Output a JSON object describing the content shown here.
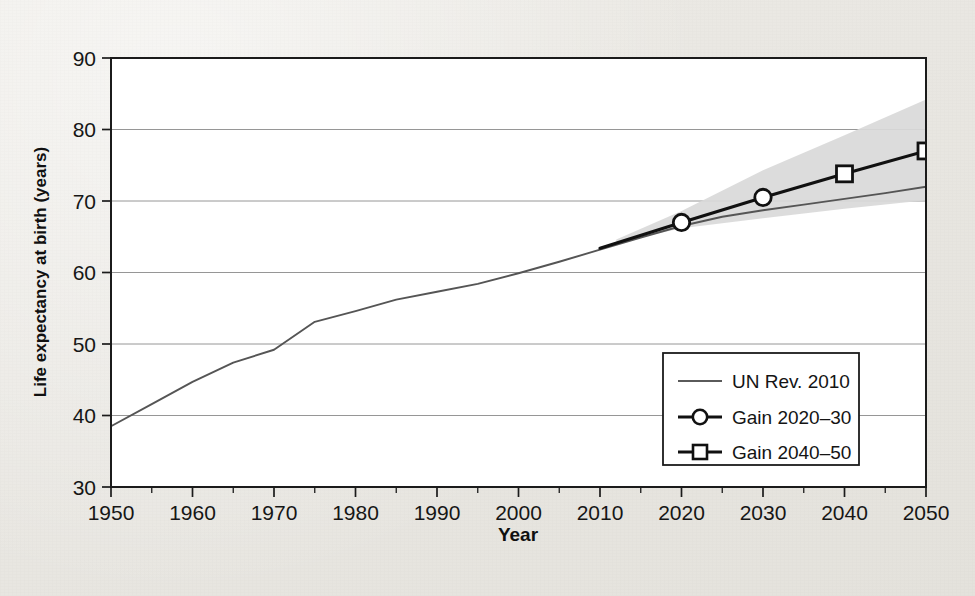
{
  "chart_data": {
    "type": "line",
    "title": "",
    "xlabel": "Year",
    "ylabel": "Life expectancy at birth (years)",
    "xlim": [
      1950,
      2050
    ],
    "ylim": [
      30,
      90
    ],
    "xticks": [
      1950,
      1960,
      1970,
      1980,
      1990,
      2000,
      2010,
      2020,
      2030,
      2040,
      2050
    ],
    "xtick_labels": [
      "1950",
      "1960",
      "1970",
      "1980",
      "1990",
      "2000",
      "2010",
      "2020",
      "2030",
      "2040",
      "2050"
    ],
    "xminor_ticks": [
      1955,
      1965,
      1975,
      1985,
      1995,
      2005,
      2015,
      2025,
      2035,
      2045
    ],
    "yticks": [
      30,
      40,
      50,
      60,
      70,
      80,
      90
    ],
    "ytick_labels": [
      "30",
      "40",
      "50",
      "60",
      "70",
      "80",
      "90"
    ],
    "grid": "horizontal",
    "legend_position": "lower right",
    "series": [
      {
        "name": "UN Rev. 2010",
        "marker": "none",
        "color": "#555555",
        "x": [
          1950,
          1955,
          1960,
          1965,
          1970,
          1975,
          1980,
          1985,
          1990,
          1995,
          2000,
          2005,
          2010,
          2015,
          2020,
          2025,
          2030,
          2035,
          2040,
          2045,
          2050
        ],
        "y": [
          38.5,
          41.6,
          44.7,
          47.4,
          49.2,
          53.1,
          54.6,
          56.2,
          57.3,
          58.4,
          59.9,
          61.5,
          63.2,
          64.9,
          66.5,
          67.8,
          68.7,
          69.5,
          70.3,
          71.1,
          72.0
        ]
      },
      {
        "name": "Gain 2020-30",
        "marker": "circle",
        "color": "#111111",
        "x": [
          2010,
          2020,
          2030
        ],
        "y": [
          63.4,
          67.0,
          70.5
        ]
      },
      {
        "name": "Gain 2040-50",
        "marker": "square",
        "color": "#111111",
        "x": [
          2030,
          2040,
          2050
        ],
        "y": [
          70.5,
          73.8,
          77.0
        ]
      }
    ],
    "uncertainty_band": {
      "name": "projection uncertainty",
      "color": "#d9d9d9",
      "x": [
        2012,
        2020,
        2030,
        2040,
        2050
      ],
      "upper": [
        64.6,
        68.6,
        74.3,
        79.2,
        84.2
      ],
      "lower": [
        64.2,
        66.2,
        67.6,
        68.9,
        70.1
      ]
    }
  },
  "legend": {
    "entries": [
      {
        "label": "UN Rev. 2010",
        "marker": "none"
      },
      {
        "label": "Gain 2020–30",
        "marker": "circle"
      },
      {
        "label": "Gain 2040–50",
        "marker": "square"
      }
    ]
  },
  "axes": {
    "x_title": "Year",
    "y_title": "Life expectancy at birth (years)"
  }
}
